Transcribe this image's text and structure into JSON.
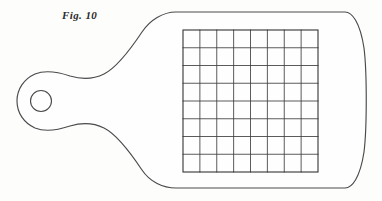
{
  "figure": {
    "caption": "Fig. 10",
    "subject_name": "perforated-paddle-with-grid",
    "colors": {
      "background": "#fdfdfc",
      "outline_stroke": "#4a4a4a",
      "grid_stroke": "#3d3d3d",
      "grid_frame_stroke": "#333333",
      "caption_text": "#2b2b2b",
      "fill": "#fefefe"
    },
    "canvas": {
      "width": 382,
      "height": 201
    },
    "grid": {
      "columns": 8,
      "rows": 8,
      "left": 183,
      "top": 30,
      "right": 318,
      "bottom": 172,
      "cell_width": 16.875,
      "cell_height": 17.75
    },
    "handle_hole": {
      "center_x": 41,
      "center_y": 101,
      "radius_x": 10.5,
      "radius_y": 10.5
    },
    "blade": {
      "top_edge_y": 12,
      "bottom_edge_y": 188,
      "right_bulge_x": 366
    },
    "outline_d": "M 345 12 C 352 12 360 22 364 48 C 367 72 367 128 364 152 C 360 178 352 188 345 188 L 176 188 C 163 188 150 182 142 170 C 132 155 118 135 104 128 C 92 122 80 123 70 126 C 58 130 45 132 35 128 C 24 123 17 113 17 101 C 17 89 24 79 35 74 C 45 70 58 72 70 76 C 80 79 92 80 104 74 C 118 67 132 47 142 32 C 150 20 163 12 176 12 Z"
  }
}
